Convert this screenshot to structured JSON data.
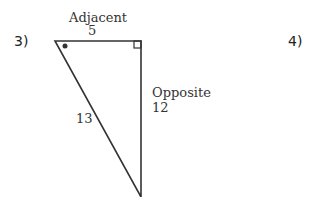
{
  "problems": [
    {
      "number": "3)",
      "triangle": {
        "adjacent_label": "Adjacent",
        "adjacent_value": "5",
        "opposite_label": "Opposite",
        "opposite_value": "12",
        "hypotenuse_value": "13",
        "angle_marker": "dot",
        "right_angle_marker": "square"
      }
    },
    {
      "number": "4)"
    }
  ],
  "colors": {
    "stroke": "#333333",
    "text": "#333333"
  }
}
